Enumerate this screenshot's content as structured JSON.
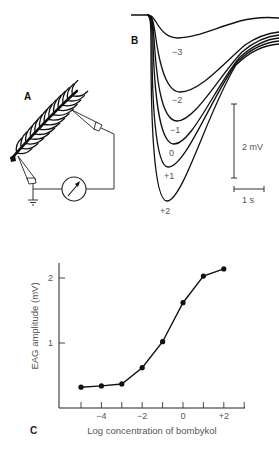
{
  "figure": {
    "panel_a": {
      "label": "A"
    },
    "panel_b": {
      "label": "B",
      "trace_labels": [
        "−3",
        "−2",
        "−1",
        "0",
        "+1",
        "+2"
      ],
      "scale_bar_voltage": "2 mV",
      "scale_bar_time": "1 s"
    },
    "panel_c": {
      "label": "C"
    }
  },
  "chart_data": [
    {
      "panel": "B",
      "type": "line",
      "title": "",
      "description": "EAG response traces (negative deflections) for log concentrations of bombykol",
      "series": [
        {
          "name": "−3",
          "peak_mV": 0.45
        },
        {
          "name": "−2",
          "peak_mV": 1.4
        },
        {
          "name": "−1",
          "peak_mV": 1.8
        },
        {
          "name": "0",
          "peak_mV": 2.2
        },
        {
          "name": "+1",
          "peak_mV": 2.5
        },
        {
          "name": "+2",
          "peak_mV": 3.0
        }
      ],
      "scale_bars": {
        "voltage": "2 mV",
        "time": "1 s"
      }
    },
    {
      "panel": "C",
      "type": "line",
      "title": "",
      "xlabel": "Log concentration of bombykol",
      "ylabel": "EAG amplitude (mV)",
      "x": [
        -5,
        -4,
        -3,
        -2,
        -1,
        0,
        1,
        2
      ],
      "series": [
        {
          "name": "EAG amplitude",
          "values": [
            0.32,
            0.34,
            0.37,
            0.62,
            1.02,
            1.62,
            2.03,
            2.14
          ]
        }
      ],
      "xticks": [
        -5,
        -4,
        -3,
        -2,
        -1,
        0,
        1,
        2,
        3
      ],
      "xtick_labels": [
        {
          "value": -4,
          "label": "−4"
        },
        {
          "value": -2,
          "label": "−2"
        },
        {
          "value": 0,
          "label": "0"
        },
        {
          "value": 2,
          "label": "+2"
        }
      ],
      "yticks": [
        {
          "value": 1,
          "label": "1"
        },
        {
          "value": 2,
          "label": "2"
        }
      ],
      "xlim": [
        -5.9,
        3.1
      ],
      "ylim": [
        0,
        2.2
      ],
      "grid": false,
      "legend": "none"
    }
  ]
}
